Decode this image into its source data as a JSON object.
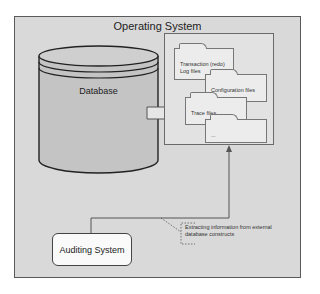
{
  "diagram": {
    "outer_container": {
      "label": "Operating System"
    },
    "database": {
      "label": "Database"
    },
    "files_container": {
      "folders": [
        {
          "label": "Transaction (redo) Log files"
        },
        {
          "label": "Configuration files"
        },
        {
          "label": "Trace files"
        },
        {
          "label": "..."
        }
      ]
    },
    "auditing_system": {
      "label": "Auditing System"
    },
    "annotation": {
      "label": "Extracting information from external database constructs"
    },
    "colors": {
      "background": "#d9d9d9",
      "cylinder": "#c4c4c4",
      "folder": "#ececec",
      "stroke": "#333333"
    }
  }
}
